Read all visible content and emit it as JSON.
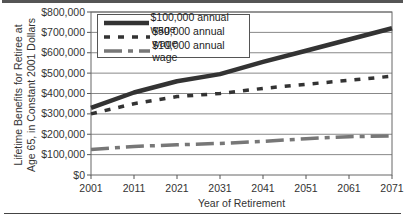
{
  "chart_data": {
    "type": "line",
    "title": "",
    "xlabel": "Year of Retirement",
    "ylabel": "Lifetime Benefits for Retiree at Age 65, in Constant 2001 Dollars",
    "ylabel_lines": [
      "Lifetime Benefits for Retiree at",
      "Age 65, in Constant 2001 Dollars"
    ],
    "x": [
      2001,
      2011,
      2021,
      2031,
      2041,
      2051,
      2061,
      2071
    ],
    "x_tick_labels": [
      "2001",
      "2011",
      "2021",
      "2031",
      "2041",
      "2051",
      "2061",
      "2071"
    ],
    "y_tick_labels": [
      "$0",
      "$100,000",
      "$200,000",
      "$300,000",
      "$400,000",
      "$500,000",
      "$600,000",
      "$700,000",
      "$800,000"
    ],
    "ylim": [
      0,
      800000
    ],
    "grid": "horizontal",
    "legend_position": "upper-left (inside)",
    "series": [
      {
        "name": "$100,000 annual wage",
        "style": "solid-thick",
        "color": "#333333",
        "values": [
          330000,
          405000,
          460000,
          495000,
          555000,
          610000,
          665000,
          720000
        ]
      },
      {
        "name": "$50,000 annual wage",
        "style": "short-dash",
        "color": "#333333",
        "values": [
          300000,
          350000,
          385000,
          400000,
          425000,
          445000,
          465000,
          485000
        ]
      },
      {
        "name": "$10,000 annual wage",
        "style": "long-dash-dot",
        "color": "#777777",
        "values": [
          125000,
          140000,
          148000,
          155000,
          165000,
          178000,
          188000,
          192000
        ]
      }
    ]
  }
}
